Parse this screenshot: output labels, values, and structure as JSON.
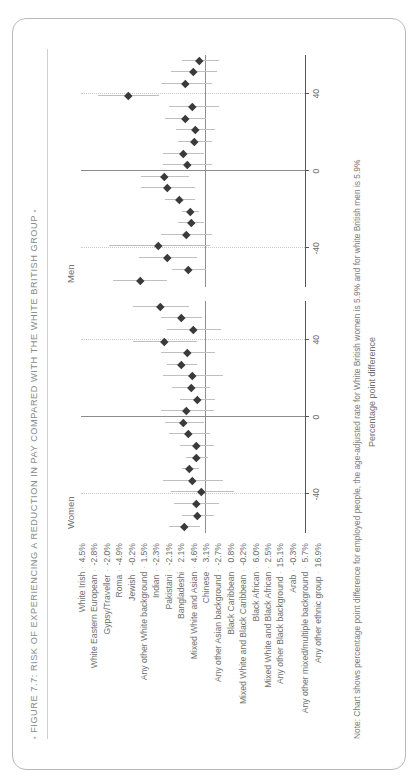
{
  "figure": {
    "title": "FIGURE 7.7: RISK OF EXPERIENCING A REDUCTION IN PAY COMPARED WITH THE WHITE BRITISH GROUP",
    "bullet": "▪",
    "xlabel": "Percentage point difference",
    "note": "Note: Chart shows percentage point difference for employed people, the age-adjusted rate for White British women is 5.9% and for white British men is 5.9%",
    "panels": [
      "Women",
      "Men"
    ]
  },
  "chart_data": {
    "type": "scatter",
    "title": "FIGURE 7.7: RISK OF EXPERIENCING A REDUCTION IN PAY COMPARED WITH THE WHITE BRITISH GROUP",
    "xlabel": "Percentage point difference",
    "ylabel": "",
    "xlim": [
      -60,
      60
    ],
    "xticks": [
      -40,
      0,
      40
    ],
    "xticklabels": [
      "-40",
      "0",
      "40"
    ],
    "grid": true,
    "legend": "none",
    "panels": [
      "Women",
      "Men"
    ],
    "categories": [
      "White Irish",
      "White Eastern European",
      "Gypsy/Traveller",
      "Roma",
      "Jewish",
      "Any other White background",
      "Indian",
      "Pakistani",
      "Bangladeshi",
      "Mixed White and Asian",
      "Chinese",
      "Any other Asian background",
      "Black Caribbean",
      "Mixed White and Black Caribbean",
      "Black African",
      "Mixed White and Black African",
      "Any other Black background",
      "Arab",
      "Any other mixed/multiple background",
      "Any other ethnic group"
    ],
    "series": [
      {
        "name": "Women",
        "values": [
          4.5,
          -2.8,
          -2.0,
          -4.9,
          -0.2,
          1.5,
          -2.3,
          -2.1,
          2.1,
          4.6,
          3.1,
          -2.7,
          0.8,
          -0.2,
          6.0,
          2.5,
          15.1,
          -0.3,
          5.7,
          16.9
        ],
        "value_labels": [
          "4.5%",
          "-2.8%",
          "-2.0%",
          "-4.9%",
          "-0.2%",
          "1.5%",
          "-2.3%",
          "-2.1%",
          "2.1%",
          "4.6%",
          "3.1%",
          "-2.7%",
          "0.8%",
          "-0.2%",
          "6.0%",
          "2.5%",
          "15.1%",
          "-0.3%",
          "5.7%",
          "16.9%"
        ],
        "err_low": [
          -4,
          -11,
          -14,
          -22,
          -16,
          -3,
          -8,
          -11,
          -9,
          -6,
          -11,
          -12,
          -9,
          -16,
          -2,
          -12,
          -2,
          -15,
          -5,
          2
        ],
        "err_high": [
          13,
          6,
          10,
          12,
          16,
          6,
          4,
          7,
          13,
          15,
          17,
          7,
          11,
          16,
          14,
          17,
          32,
          14,
          17,
          32
        ]
      },
      {
        "name": "Men",
        "values": [
          28.0,
          2.0,
          13.2,
          18.1,
          3.3,
          0.7,
          1.3,
          6.7,
          13.4,
          14.9,
          2.7,
          4.9,
          -1.0,
          -1.4,
          3.6,
          -0.2,
          34.4,
          3.5,
          -0.7,
          -3.7
        ],
        "value_labels": [
          "28.0%",
          "2.0%",
          "13.2%",
          "18.1%",
          "3.3%",
          "0.7%",
          "1.3%",
          "6.7%",
          "13.4%",
          "14.9%",
          "2.7%",
          "4.9%",
          "-1.0%",
          "-1.4%",
          "3.6%",
          "-0.2%",
          "34.4%",
          "3.5%",
          "-0.7%",
          "-3.7%"
        ],
        "err_low": [
          14,
          -7,
          -2,
          -9,
          -10,
          -6,
          -3,
          -1,
          -1,
          2,
          -10,
          -6,
          -10,
          -12,
          -7,
          -14,
          18,
          -10,
          -13,
          -14
        ],
        "err_high": [
          43,
          11,
          29,
          45,
          17,
          8,
          6,
          15,
          28,
          28,
          16,
          16,
          8,
          9,
          15,
          13,
          51,
          17,
          12,
          6
        ]
      }
    ]
  }
}
